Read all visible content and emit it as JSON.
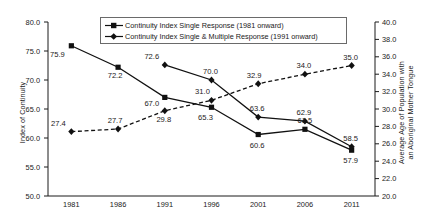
{
  "chart_data": {
    "type": "line",
    "title": "",
    "xlabel": "",
    "categories": [
      "1981",
      "1986",
      "1991",
      "1996",
      "2001",
      "2006",
      "2011"
    ],
    "grid": false,
    "legend_position": "top-center",
    "left_axis": {
      "label": "Index of Continuity",
      "ylim": [
        50.0,
        80.0
      ],
      "ticks": [
        "50.0",
        "55.0",
        "60.0",
        "65.0",
        "70.0",
        "75.0",
        "80.0"
      ],
      "tick_values": [
        50.0,
        55.0,
        60.0,
        65.0,
        70.0,
        75.0,
        80.0
      ]
    },
    "right_axis": {
      "label_line1": "Average Age of Population with",
      "label_line2": "an Aboriginal Mother Tongue",
      "ylim": [
        20.0,
        40.0
      ],
      "ticks": [
        "20.0",
        "22.0",
        "24.0",
        "26.0",
        "28.0",
        "30.0",
        "32.0",
        "34.0",
        "36.0",
        "38.0",
        "40.0"
      ],
      "tick_values": [
        20.0,
        22.0,
        24.0,
        26.0,
        28.0,
        30.0,
        32.0,
        34.0,
        36.0,
        38.0,
        40.0
      ]
    },
    "series": [
      {
        "name": "Continuity Index Single Response (1981 onward)",
        "axis": "left",
        "marker": "square",
        "line_style": "solid",
        "color": "#111111",
        "x": [
          "1981",
          "1986",
          "1991",
          "1996",
          "2001",
          "2006",
          "2011"
        ],
        "values": [
          75.9,
          72.2,
          67.0,
          65.3,
          60.6,
          61.5,
          57.9
        ],
        "labels": [
          "75.9",
          "72.2",
          "67.0",
          "65.3",
          "60.6",
          "61.5",
          "57.9"
        ]
      },
      {
        "name": "Continuity Index Single & Multiple Response (1991 onward)",
        "axis": "left",
        "marker": "diamond",
        "line_style": "solid",
        "color": "#111111",
        "x": [
          "1991",
          "1996",
          "2001",
          "2006",
          "2011"
        ],
        "values": [
          72.6,
          70.0,
          63.6,
          62.9,
          58.5
        ],
        "labels": [
          "72.6",
          "70.0",
          "63.6",
          "62.9",
          "58.5"
        ]
      },
      {
        "name": "Average Age of Population with an Aboriginal Mother Tongue",
        "axis": "right",
        "marker": "diamond",
        "line_style": "dashed",
        "color": "#111111",
        "x": [
          "1981",
          "1986",
          "1991",
          "1996",
          "2001",
          "2006",
          "2011"
        ],
        "values": [
          27.4,
          27.7,
          29.8,
          31.0,
          32.9,
          34.0,
          35.0
        ],
        "labels": [
          "27.4",
          "27.7",
          "29.8",
          "31.0",
          "32.9",
          "34.0",
          "35.0"
        ]
      }
    ]
  },
  "legend": {
    "items": [
      {
        "label": "Continuity Index Single Response (1981 onward)"
      },
      {
        "label": "Continuity Index Single & Multiple Response (1991 onward)"
      }
    ]
  }
}
